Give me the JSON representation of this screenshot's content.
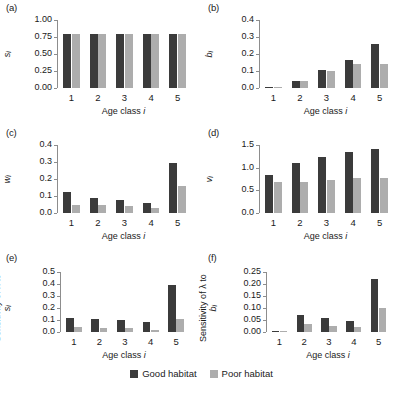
{
  "figure": {
    "legend": {
      "good_label": "Good habitat",
      "poor_label": "Poor habitat",
      "good_color": "#3b3b3b",
      "poor_color": "#adadad"
    },
    "series_names": [
      "Good habitat",
      "Poor habitat"
    ],
    "shared_xlabel": "Age class i",
    "shared_categories": [
      "1",
      "2",
      "3",
      "4",
      "5"
    ]
  },
  "panels": [
    {
      "key": "a",
      "tag": "(a)",
      "ylabel_main": "s",
      "ylabel_sub": "i",
      "ylabel_prefix": "",
      "xlabel_text": "Age class ",
      "xlabel_italic": "i",
      "yticks": [
        "0.00",
        "0.25",
        "0.50",
        "0.75",
        "1.00"
      ]
    },
    {
      "key": "b",
      "tag": "(b)",
      "ylabel_main": "b",
      "ylabel_sub": "i",
      "ylabel_prefix": "",
      "xlabel_text": "Age class ",
      "xlabel_italic": "i",
      "yticks": [
        "0.0",
        "0.1",
        "0.2",
        "0.3",
        "0.4"
      ]
    },
    {
      "key": "c",
      "tag": "(c)",
      "ylabel_main": "w",
      "ylabel_sub": "i",
      "ylabel_prefix": "",
      "xlabel_text": "Age class ",
      "xlabel_italic": "i",
      "yticks": [
        "0.0",
        "0.1",
        "0.2",
        "0.3",
        "0.4"
      ]
    },
    {
      "key": "d",
      "tag": "(d)",
      "ylabel_main": "v",
      "ylabel_sub": "i",
      "ylabel_prefix": "",
      "xlabel_text": "Age class ",
      "xlabel_italic": "i",
      "yticks": [
        "0.0",
        "0.5",
        "1.0",
        "1.5"
      ]
    },
    {
      "key": "e",
      "tag": "(e)",
      "ylabel_main": "s",
      "ylabel_sub": "i",
      "ylabel_prefix": "Sensitivity of λ to ",
      "xlabel_text": "Age class ",
      "xlabel_italic": "i",
      "yticks": [
        "0.0",
        "0.1",
        "0.2",
        "0.3",
        "0.4",
        "0.5"
      ]
    },
    {
      "key": "f",
      "tag": "(f)",
      "ylabel_main": "b",
      "ylabel_sub": "i",
      "ylabel_prefix": "Sensitivity of λ to ",
      "xlabel_text": "Age class ",
      "xlabel_italic": "i",
      "yticks": [
        "0.00",
        "0.05",
        "0.10",
        "0.15",
        "0.20",
        "0.25"
      ]
    }
  ],
  "chart_data": [
    {
      "type": "bar",
      "panel": "(a)",
      "title": "",
      "categories": [
        "1",
        "2",
        "3",
        "4",
        "5"
      ],
      "series": [
        {
          "name": "Good habitat",
          "values": [
            0.8,
            0.8,
            0.8,
            0.8,
            0.8
          ]
        },
        {
          "name": "Poor habitat",
          "values": [
            0.8,
            0.8,
            0.8,
            0.8,
            0.8
          ]
        }
      ],
      "xlabel": "Age class i",
      "ylabel": "s_i",
      "ylim": [
        0,
        1.0
      ],
      "yticks": [
        0.0,
        0.25,
        0.5,
        0.75,
        1.0
      ],
      "grid": false,
      "legend_position": "figure-bottom"
    },
    {
      "type": "bar",
      "panel": "(b)",
      "title": "",
      "categories": [
        "1",
        "2",
        "3",
        "4",
        "5"
      ],
      "series": [
        {
          "name": "Good habitat",
          "values": [
            0.0,
            0.04,
            0.105,
            0.165,
            0.26
          ]
        },
        {
          "name": "Poor habitat",
          "values": [
            0.0,
            0.04,
            0.1,
            0.14,
            0.14
          ]
        }
      ],
      "xlabel": "Age class i",
      "ylabel": "b_i",
      "ylim": [
        0,
        0.4
      ],
      "yticks": [
        0.0,
        0.1,
        0.2,
        0.3,
        0.4
      ],
      "grid": false,
      "legend_position": "figure-bottom"
    },
    {
      "type": "bar",
      "panel": "(c)",
      "title": "",
      "categories": [
        "1",
        "2",
        "3",
        "4",
        "5"
      ],
      "series": [
        {
          "name": "Good habitat",
          "values": [
            0.125,
            0.09,
            0.075,
            0.06,
            0.295
          ]
        },
        {
          "name": "Poor habitat",
          "values": [
            0.05,
            0.045,
            0.04,
            0.03,
            0.16
          ]
        }
      ],
      "xlabel": "Age class i",
      "ylabel": "w_i",
      "ylim": [
        0,
        0.4
      ],
      "yticks": [
        0.0,
        0.1,
        0.2,
        0.3,
        0.4
      ],
      "grid": false,
      "legend_position": "figure-bottom"
    },
    {
      "type": "bar",
      "panel": "(d)",
      "title": "",
      "categories": [
        "1",
        "2",
        "3",
        "4",
        "5"
      ],
      "series": [
        {
          "name": "Good habitat",
          "values": [
            0.83,
            1.11,
            1.24,
            1.35,
            1.42
          ]
        },
        {
          "name": "Poor habitat",
          "values": [
            0.68,
            0.68,
            0.73,
            0.77,
            0.77
          ]
        }
      ],
      "xlabel": "Age class i",
      "ylabel": "v_i",
      "ylim": [
        0,
        1.5
      ],
      "yticks": [
        0.0,
        0.5,
        1.0,
        1.5
      ],
      "grid": false,
      "legend_position": "figure-bottom"
    },
    {
      "type": "bar",
      "panel": "(e)",
      "title": "",
      "categories": [
        "1",
        "2",
        "3",
        "4",
        "5"
      ],
      "series": [
        {
          "name": "Good habitat",
          "values": [
            0.115,
            0.11,
            0.1,
            0.085,
            0.395
          ]
        },
        {
          "name": "Poor habitat",
          "values": [
            0.04,
            0.035,
            0.03,
            0.02,
            0.11
          ]
        }
      ],
      "xlabel": "Age class i",
      "ylabel": "Sensitivity of lambda to s_i",
      "ylim": [
        0,
        0.5
      ],
      "yticks": [
        0.0,
        0.1,
        0.2,
        0.3,
        0.4,
        0.5
      ],
      "grid": false,
      "legend_position": "figure-bottom"
    },
    {
      "type": "bar",
      "panel": "(f)",
      "title": "",
      "categories": [
        "1",
        "2",
        "3",
        "4",
        "5"
      ],
      "series": [
        {
          "name": "Good habitat",
          "values": [
            0.0,
            0.07,
            0.057,
            0.045,
            0.22
          ]
        },
        {
          "name": "Poor habitat",
          "values": [
            0.0,
            0.032,
            0.027,
            0.022,
            0.1
          ]
        }
      ],
      "xlabel": "Age class i",
      "ylabel": "Sensitivity of lambda to b_i",
      "ylim": [
        0,
        0.25
      ],
      "yticks": [
        0.0,
        0.05,
        0.1,
        0.15,
        0.2,
        0.25
      ],
      "grid": false,
      "legend_position": "figure-bottom"
    }
  ]
}
